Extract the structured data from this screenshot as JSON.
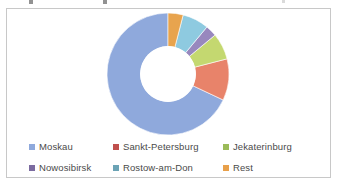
{
  "frame": {
    "border_color": "#c8c8c8",
    "background": "#ffffff"
  },
  "chart_data": {
    "type": "pie",
    "variant": "donut",
    "title": "",
    "subtitle": "",
    "xlabel": "",
    "ylabel": "",
    "legend_position": "bottom",
    "grid": false,
    "hole_ratio": 0.45,
    "start_angle_deg": 0,
    "direction": "counterclockwise",
    "categories": [
      "Moskau",
      "Sankt-Petersburg",
      "Jekaterinburg",
      "Nowosibirsk",
      "Rostow-am-Don",
      "Rest"
    ],
    "values": [
      68,
      11,
      7,
      3,
      7,
      4
    ],
    "colors": [
      "#8fa9dc",
      "#e8836a",
      "#c4d870",
      "#9888be",
      "#8ecae0",
      "#e8a44e"
    ],
    "slices": [
      {
        "label": "Moskau",
        "value": 68,
        "color": "#8fa9dc"
      },
      {
        "label": "Sankt-Petersburg",
        "value": 11,
        "color": "#e8836a"
      },
      {
        "label": "Jekaterinburg",
        "value": 7,
        "color": "#c4d870"
      },
      {
        "label": "Nowosibirsk",
        "value": 3,
        "color": "#9888be"
      },
      {
        "label": "Rostow-am-Don",
        "value": 7,
        "color": "#8ecae0"
      },
      {
        "label": "Rest",
        "value": 4,
        "color": "#e8a44e"
      }
    ]
  },
  "legend": {
    "rows": [
      [
        {
          "label": "Moskau",
          "color": "#8fa9dc"
        },
        {
          "label": "Sankt-Petersburg",
          "color": "#c0504d"
        },
        {
          "label": "Jekaterinburg",
          "color": "#9bbb59"
        }
      ],
      [
        {
          "label": "Nowosibirsk",
          "color": "#7b6ba0"
        },
        {
          "label": "Rostow-am-Don",
          "color": "#6ba3b5"
        },
        {
          "label": "Rest",
          "color": "#e8a04a"
        }
      ]
    ]
  }
}
